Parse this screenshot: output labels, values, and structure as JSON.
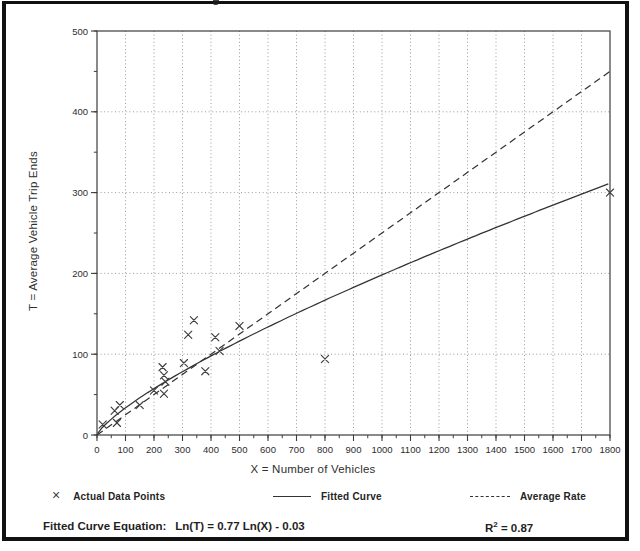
{
  "remnant_glyph": "p",
  "chart_data": {
    "type": "scatter",
    "title": "",
    "xlabel": "X = Number of Vehicles",
    "ylabel": "T = Average Vehicle Trip Ends",
    "xlim": [
      0,
      1800
    ],
    "ylim": [
      0,
      500
    ],
    "x_ticks": [
      0,
      100,
      200,
      300,
      400,
      500,
      600,
      700,
      800,
      900,
      1000,
      1100,
      1200,
      1300,
      1400,
      1500,
      1600,
      1700,
      1800
    ],
    "y_ticks": [
      0,
      100,
      200,
      300,
      400,
      500
    ],
    "x_minor_step": 50,
    "y_minor_step": 50,
    "grid": "dotted lines at every major tick, both axes",
    "legend_position": "bottom",
    "points": [
      [
        20,
        13
      ],
      [
        62,
        30
      ],
      [
        70,
        15
      ],
      [
        80,
        37
      ],
      [
        150,
        37
      ],
      [
        200,
        55
      ],
      [
        230,
        84
      ],
      [
        235,
        74
      ],
      [
        240,
        66
      ],
      [
        235,
        51
      ],
      [
        305,
        89
      ],
      [
        320,
        124
      ],
      [
        340,
        142
      ],
      [
        380,
        79
      ],
      [
        415,
        121
      ],
      [
        430,
        104
      ],
      [
        500,
        135
      ],
      [
        800,
        94
      ],
      [
        1800,
        300
      ]
    ],
    "fitted_curve": {
      "model": "Ln(T) = 0.77 Ln(X) - 0.03",
      "ln_coef": 0.77,
      "ln_intercept": -0.03
    },
    "average_rate": 0.25,
    "r_squared": 0.87,
    "colors": {
      "ink": "#2b2b2b",
      "grid": "#909090",
      "axis": "#3d3d3d",
      "marker": "#3f3f3f",
      "curve": "#333333"
    }
  },
  "legend": {
    "marker_glyph": "×",
    "actual_label": "Actual Data Points",
    "fitted_label": "Fitted Curve",
    "average_label": "Average Rate"
  },
  "footer": {
    "equation_label": "Fitted Curve Equation:",
    "equation_value": "Ln(T) = 0.77 Ln(X) - 0.03",
    "r2_base": "R",
    "r2_exp": "2",
    "r2_value": " = 0.87"
  }
}
